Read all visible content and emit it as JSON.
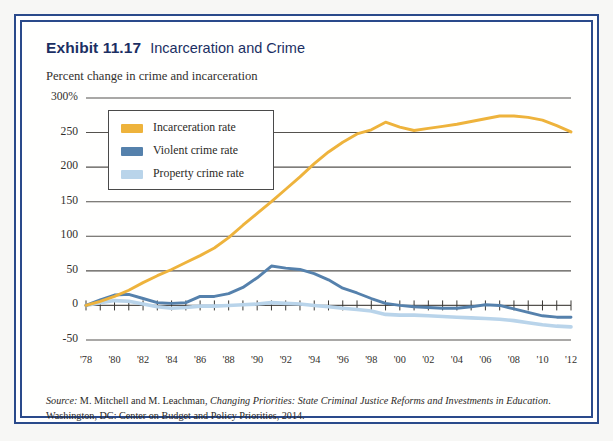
{
  "exhibit": {
    "label": "Exhibit 11.17",
    "title": "Incarceration and Crime",
    "subtitle": "Percent change in crime and incarceration"
  },
  "source": {
    "prefix": "Source:",
    "authors": " M. Mitchell and M. Leachman, ",
    "work": "Changing Priorities: State Criminal Justice Reforms and Investments in Education",
    "publisher": ". Washington, DC: Center on Budget and Policy Priorities, 2014."
  },
  "colors": {
    "incarceration": "#eeb33c",
    "violent": "#5581ac",
    "property": "#b9d4ea",
    "frame": "#2a4a8b",
    "gridline": "#55524e",
    "axis": "#3a3834"
  },
  "legend": {
    "position": "upper-left-inside",
    "items": [
      {
        "label": "Incarceration rate",
        "color": "#eeb33c"
      },
      {
        "label": "Violent crime rate",
        "color": "#5581ac"
      },
      {
        "label": "Property crime rate",
        "color": "#b9d4ea"
      }
    ]
  },
  "chart_data": {
    "type": "line",
    "title": "Incarceration and Crime",
    "subtitle": "Percent change in crime and incarceration",
    "xlabel": "",
    "ylabel": "Percent change in crime and incarceration",
    "ylim": [
      -50,
      300
    ],
    "yticks": [
      -50,
      0,
      50,
      100,
      150,
      200,
      250,
      300
    ],
    "ytick_labels": [
      "-50",
      "0",
      "50",
      "100",
      "150",
      "200",
      "250",
      "300%"
    ],
    "xlim": [
      1978,
      2012
    ],
    "xticks": [
      1978,
      1980,
      1982,
      1984,
      1986,
      1988,
      1990,
      1992,
      1994,
      1996,
      1998,
      2000,
      2002,
      2004,
      2006,
      2008,
      2010,
      2012
    ],
    "xtick_labels": [
      "'78",
      "'80",
      "'82",
      "'84",
      "'86",
      "'88",
      "'90",
      "'92",
      "'94",
      "'96",
      "'98",
      "'00",
      "'02",
      "'04",
      "'06",
      "'08",
      "'10",
      "'12"
    ],
    "grid": "horizontal",
    "x": [
      1978,
      1979,
      1980,
      1981,
      1982,
      1983,
      1984,
      1985,
      1986,
      1987,
      1988,
      1989,
      1990,
      1991,
      1992,
      1993,
      1994,
      1995,
      1996,
      1997,
      1998,
      1999,
      2000,
      2001,
      2002,
      2003,
      2004,
      2005,
      2006,
      2007,
      2008,
      2009,
      2010,
      2011,
      2012
    ],
    "series": [
      {
        "name": "Incarceration rate",
        "color": "#eeb33c",
        "values": [
          0,
          6,
          13,
          22,
          33,
          43,
          52,
          62,
          72,
          83,
          98,
          116,
          133,
          150,
          168,
          186,
          205,
          222,
          236,
          248,
          254,
          265,
          258,
          253,
          256,
          259,
          262,
          266,
          270,
          274,
          274,
          272,
          268,
          260,
          251
        ]
      },
      {
        "name": "Violent crime rate",
        "color": "#5581ac",
        "values": [
          0,
          8,
          15,
          16,
          10,
          4,
          3,
          4,
          13,
          13,
          17,
          26,
          40,
          57,
          54,
          52,
          46,
          37,
          25,
          18,
          10,
          3,
          0,
          -2,
          -3,
          -4,
          -4,
          -2,
          1,
          0,
          -5,
          -10,
          -15,
          -17,
          -17
        ]
      },
      {
        "name": "Property crime rate",
        "color": "#b9d4ea",
        "values": [
          0,
          4,
          7,
          6,
          2,
          -2,
          -4,
          -3,
          -1,
          -1,
          0,
          1,
          2,
          4,
          3,
          2,
          0,
          -2,
          -4,
          -6,
          -8,
          -13,
          -14,
          -14,
          -15,
          -16,
          -17,
          -18,
          -19,
          -20,
          -22,
          -25,
          -28,
          -30,
          -31
        ]
      }
    ]
  }
}
